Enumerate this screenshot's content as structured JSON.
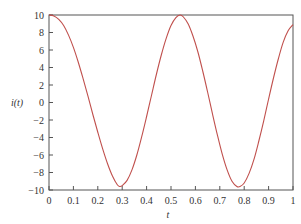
{
  "chart_data": {
    "type": "line",
    "title": "",
    "xlabel": "t",
    "ylabel": "i(t)",
    "xlim": [
      0,
      1
    ],
    "ylim": [
      -10,
      10
    ],
    "grid": false,
    "legend": null,
    "x_ticks": [
      0,
      0.1,
      0.2,
      0.3,
      0.4,
      0.5,
      0.6,
      0.7,
      0.8,
      0.9,
      1
    ],
    "x_tick_labels": [
      "0",
      "0.1",
      "0.2",
      "0.3",
      "0.4",
      "0.5",
      "0.6",
      "0.7",
      "0.8",
      "0.9",
      "1"
    ],
    "y_ticks": [
      10,
      8,
      6,
      4,
      2,
      0,
      -2,
      -4,
      -6,
      -8,
      -10
    ],
    "y_tick_labels": [
      "10",
      "8",
      "6",
      "4",
      "2",
      "0",
      "−2",
      "−4",
      "−6",
      "−8",
      "−10"
    ],
    "series": [
      {
        "name": "i(t)",
        "color": "#c0504d",
        "x": [
          0,
          0.02,
          0.04,
          0.06,
          0.08,
          0.1,
          0.12,
          0.14,
          0.16,
          0.18,
          0.2,
          0.22,
          0.24,
          0.26,
          0.28,
          0.29,
          0.3,
          0.32,
          0.34,
          0.36,
          0.38,
          0.4,
          0.42,
          0.44,
          0.46,
          0.48,
          0.5,
          0.52,
          0.537,
          0.55,
          0.57,
          0.59,
          0.61,
          0.63,
          0.65,
          0.67,
          0.69,
          0.71,
          0.73,
          0.75,
          0.77,
          0.783,
          0.8,
          0.82,
          0.84,
          0.86,
          0.88,
          0.9,
          0.92,
          0.94,
          0.96,
          0.98,
          1.0
        ],
        "y": [
          10,
          9.9,
          9.5,
          8.8,
          7.7,
          6.3,
          4.6,
          2.7,
          0.7,
          -1.4,
          -3.4,
          -5.3,
          -7.0,
          -8.4,
          -9.4,
          -9.6,
          -9.5,
          -8.9,
          -7.7,
          -6.0,
          -3.9,
          -1.6,
          0.8,
          3.2,
          5.4,
          7.3,
          8.8,
          9.7,
          10.0,
          9.8,
          9.0,
          7.6,
          5.8,
          3.6,
          1.2,
          -1.3,
          -3.7,
          -5.9,
          -7.7,
          -9.0,
          -9.6,
          -9.6,
          -9.2,
          -8.1,
          -6.5,
          -4.4,
          -2.1,
          0.4,
          2.8,
          5.0,
          6.9,
          8.2,
          8.9
        ]
      }
    ]
  },
  "colors": {
    "line": "#c0504d",
    "axis": "#555555",
    "text": "#333333"
  }
}
